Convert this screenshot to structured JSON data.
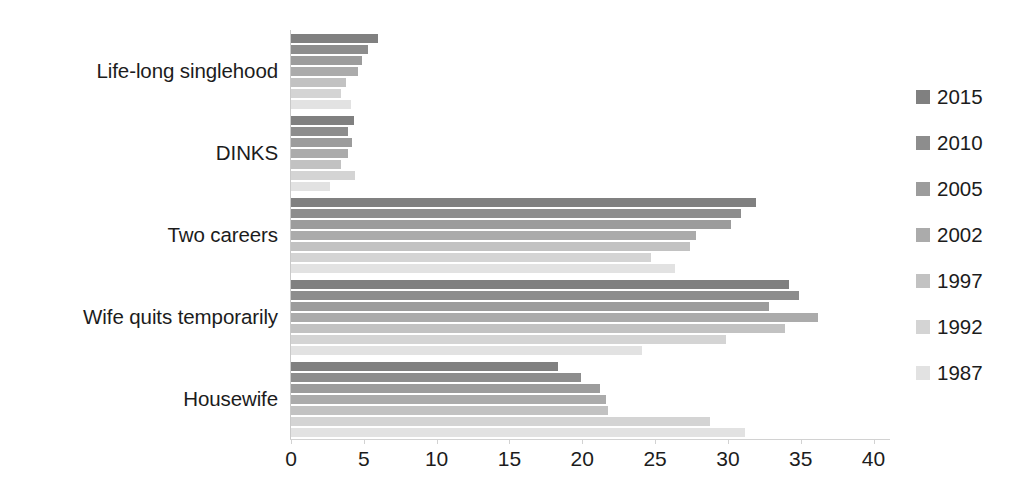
{
  "chart_data": {
    "type": "bar",
    "orientation": "horizontal",
    "title": "",
    "xlabel": "",
    "ylabel": "",
    "categories": [
      "Life-long singlehood",
      "DINKS",
      "Two careers",
      "Wife quits temporarily",
      "Housewife"
    ],
    "series": [
      {
        "name": "2015",
        "color": "#808080",
        "values": [
          6.0,
          4.3,
          31.9,
          34.2,
          18.3
        ]
      },
      {
        "name": "2010",
        "color": "#8d8d8d",
        "values": [
          5.3,
          3.9,
          30.9,
          34.9,
          19.9
        ]
      },
      {
        "name": "2005",
        "color": "#9c9c9c",
        "values": [
          4.9,
          4.2,
          30.2,
          32.8,
          21.2
        ]
      },
      {
        "name": "2002",
        "color": "#ababab",
        "values": [
          4.6,
          3.9,
          27.8,
          36.2,
          21.6
        ]
      },
      {
        "name": "1997",
        "color": "#c2c2c2",
        "values": [
          3.8,
          3.4,
          27.4,
          33.9,
          21.8
        ]
      },
      {
        "name": "1992",
        "color": "#d4d4d4",
        "values": [
          3.4,
          4.4,
          24.7,
          29.9,
          28.8
        ]
      },
      {
        "name": "1987",
        "color": "#e2e2e2",
        "values": [
          4.1,
          2.7,
          26.4,
          24.1,
          31.2
        ]
      }
    ],
    "xticks": [
      0,
      5,
      10,
      15,
      20,
      25,
      30,
      35,
      40
    ],
    "xlim": [
      0,
      41.2
    ],
    "grid": false,
    "legend_position": "right",
    "axis_color": "#cccccc",
    "text_color": "#1c1c1c"
  }
}
